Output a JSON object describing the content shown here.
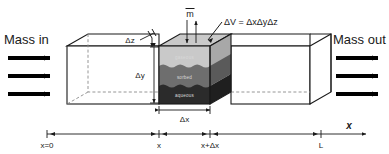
{
  "figure": {
    "title_alt": "Control volume mass balance diagram",
    "labels": {
      "mass_in": "Mass in",
      "mass_out": "Mass out",
      "mdot": "m",
      "volume_equation": "ΔV = ΔxΔyΔz",
      "delta_x": "Δx",
      "delta_y": "Δy",
      "delta_z": "Δz"
    },
    "phases": [
      {
        "name": "gaseous",
        "fill": "#c9c9c9"
      },
      {
        "name": "sorbed",
        "fill": "#6e6e6e"
      },
      {
        "name": "aqueous",
        "fill": "#2b2b2b"
      }
    ],
    "axis": {
      "name": "x",
      "ticks": [
        {
          "label": "x=0"
        },
        {
          "label": "x"
        },
        {
          "label": "x+Δx"
        },
        {
          "label": "L"
        }
      ]
    },
    "colors": {
      "line": "#1a1a1a",
      "hidden_edge": "#8a8a8a",
      "gaseous": "#c9c9c9",
      "sorbed": "#6e6e6e",
      "aqueous": "#2b2b2b",
      "background": "#ffffff"
    }
  }
}
